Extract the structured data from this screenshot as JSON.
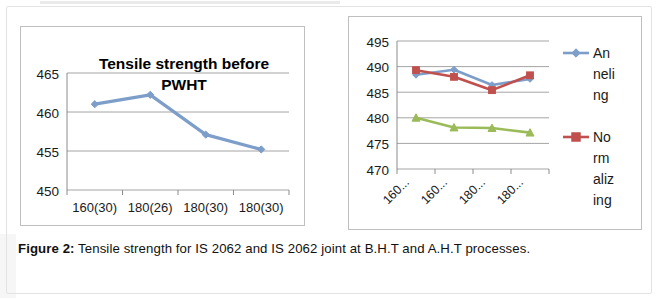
{
  "figure": {
    "caption_label": "Figure 2:",
    "caption_text": " Tensile strength for IS 2062 and IS 2062 joint at B.H.T and A.H.T processes."
  },
  "colors": {
    "series_blue": "#7d9ec9",
    "series_red": "#c0504d",
    "series_green": "#9bbb59",
    "grid": "#9a9a9a",
    "axis": "#808080",
    "box_border": "#bfbfbf",
    "text": "#111111"
  },
  "chart_data": [
    {
      "id": "tensile-before-pwht",
      "type": "line",
      "title": "Tensile strength before PWHT",
      "title_line1": "Tensile strength before",
      "title_line2": "PWHT",
      "xlabel": "",
      "ylabel": "",
      "categories": [
        "160(30)",
        "180(26)",
        "180(30)",
        "180(30)"
      ],
      "yticks": [
        450,
        455,
        460,
        465
      ],
      "ylim": [
        450,
        465
      ],
      "grid": true,
      "legend": "none",
      "series": [
        {
          "name": "Tensile strength before PWHT",
          "color": "#7d9ec9",
          "marker": "diamond",
          "values": [
            461,
            462.2,
            457.1,
            455.2
          ]
        }
      ]
    },
    {
      "id": "tensile-after-pwht",
      "type": "line",
      "title": "",
      "xlabel": "",
      "ylabel": "",
      "categories": [
        "160...",
        "160...",
        "180...",
        "180..."
      ],
      "yticks": [
        470,
        475,
        480,
        485,
        490,
        495
      ],
      "ylim": [
        470,
        495
      ],
      "grid": true,
      "legend": "right",
      "series": [
        {
          "name": "Anneling",
          "legend_lines": [
            "An",
            "neli",
            "ng"
          ],
          "color": "#7d9ec9",
          "marker": "diamond",
          "values": [
            488.4,
            489.4,
            486.4,
            487.6
          ]
        },
        {
          "name": "Normalizing",
          "legend_lines": [
            "No",
            "rm",
            "aliz",
            "ing"
          ],
          "color": "#c0504d",
          "marker": "square",
          "values": [
            489.3,
            488.0,
            485.4,
            488.3
          ]
        },
        {
          "name": "",
          "legend_lines": [],
          "color": "#9bbb59",
          "marker": "triangle",
          "values": [
            480.0,
            478.1,
            478.0,
            477.1
          ]
        }
      ]
    }
  ]
}
